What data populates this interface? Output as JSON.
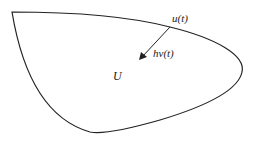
{
  "diagram": {
    "region_label": "U",
    "point_label": "u(t)",
    "vector_label": "hv(t)",
    "stroke_color": "#222222",
    "background": "#ffffff"
  }
}
